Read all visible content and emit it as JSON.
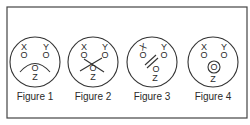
{
  "diagram": {
    "frame": {
      "x": 7,
      "y": 7,
      "width": 240,
      "height": 111,
      "stroke": "#444444"
    },
    "stroke_color": "#333333",
    "point_labels": {
      "x": "X",
      "y": "Y",
      "z": "Z",
      "marker": "O"
    },
    "figures": [
      {
        "caption": "Figure 1",
        "cx": 35,
        "cy": 62,
        "r": 25,
        "feature": "arc-over-z"
      },
      {
        "caption": "Figure 2",
        "cx": 93,
        "cy": 62,
        "r": 25,
        "feature": "cross-over-z"
      },
      {
        "caption": "Figure 3",
        "cx": 152,
        "cy": 62,
        "r": 25,
        "feature": "double-slash-between-x-and-z"
      },
      {
        "caption": "Figure 4",
        "cx": 213,
        "cy": 62,
        "r": 25,
        "feature": "ring-around-z"
      }
    ]
  }
}
